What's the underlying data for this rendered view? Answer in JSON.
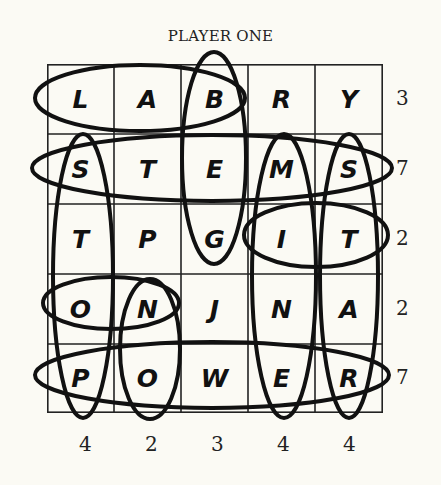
{
  "title": "PLAYER ONE",
  "grid": [
    [
      "L",
      "A",
      "B",
      "R",
      "Y"
    ],
    [
      "S",
      "T",
      "E",
      "M",
      "S"
    ],
    [
      "T",
      "P",
      "G",
      "I",
      "T"
    ],
    [
      "O",
      "N",
      "J",
      "N",
      "A"
    ],
    [
      "P",
      "O",
      "W",
      "E",
      "R"
    ]
  ],
  "row_clues": [
    "3",
    "7",
    "2",
    "2",
    "7"
  ],
  "col_clues": [
    "4",
    "2",
    "3",
    "4",
    "4"
  ],
  "circled_words": [
    {
      "word": "LAB",
      "dir": "horizontal",
      "row": 0,
      "from_col": 0,
      "to_col": 2
    },
    {
      "word": "STEMS",
      "dir": "horizontal",
      "row": 1,
      "from_col": 0,
      "to_col": 4
    },
    {
      "word": "IT",
      "dir": "horizontal",
      "row": 2,
      "from_col": 3,
      "to_col": 4
    },
    {
      "word": "ON",
      "dir": "horizontal",
      "row": 3,
      "from_col": 0,
      "to_col": 1
    },
    {
      "word": "POWER",
      "dir": "horizontal",
      "row": 4,
      "from_col": 0,
      "to_col": 4
    },
    {
      "word": "STOP",
      "dir": "vertical",
      "col": 0,
      "from_row": 1,
      "to_row": 4
    },
    {
      "word": "NO",
      "dir": "vertical",
      "col": 1,
      "from_row": 3,
      "to_row": 4
    },
    {
      "word": "BEG",
      "dir": "vertical",
      "col": 2,
      "from_row": 0,
      "to_row": 2
    },
    {
      "word": "MINE",
      "dir": "vertical",
      "col": 3,
      "from_row": 1,
      "to_row": 4
    },
    {
      "word": "STAR",
      "dir": "vertical",
      "col": 4,
      "from_row": 1,
      "to_row": 4
    }
  ]
}
